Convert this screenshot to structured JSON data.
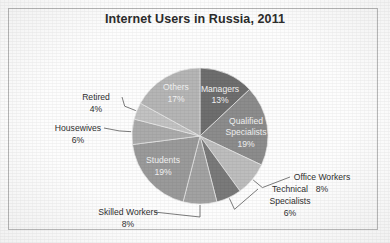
{
  "chart_data": {
    "type": "pie",
    "title": "Internet Users in Russia, 2011",
    "xlabel": "",
    "ylabel": "",
    "legend": "none",
    "grid": false,
    "units": "percent",
    "total": 100,
    "categories": [
      "Managers",
      "Qualified Specialists",
      "Office Workers",
      "Technical Specialists",
      "Skilled Workers",
      "Students",
      "Housewives",
      "Retired",
      "Others"
    ],
    "values": [
      13,
      19,
      8,
      6,
      8,
      19,
      6,
      4,
      17
    ],
    "slices": [
      {
        "label": "Managers",
        "value": 13,
        "value_text": "13%",
        "color": "#6e6e6e",
        "placement": "inside",
        "label_x": 220,
        "label_y": 92,
        "value_x": 220,
        "value_y": 103
      },
      {
        "label": "Qualified Specialists",
        "value": 19,
        "value_text": "19%",
        "color": "#8c8c8c",
        "placement": "inside",
        "label_x": 246,
        "label_y": 124,
        "value_x": 246,
        "value_y": 147,
        "label_line2": "Specialists",
        "label_y2": 135
      },
      {
        "label": "Office Workers",
        "value": 8,
        "value_text": "8%",
        "color": "#bdbdbd",
        "placement": "outside",
        "label_x": 322,
        "label_y": 180,
        "value_x": 322,
        "value_y": 192
      },
      {
        "label": "Technical Specialists",
        "value": 6,
        "value_text": "6%",
        "color": "#7a7a7a",
        "placement": "outside",
        "label_x": 290,
        "label_y": 192,
        "value_x": 290,
        "value_y": 216,
        "label_line2": "Specialists",
        "label_y2": 204
      },
      {
        "label": "Skilled Workers",
        "value": 8,
        "value_text": "8%",
        "color": "#a2a2a2",
        "placement": "outside",
        "label_x": 128,
        "label_y": 215,
        "value_x": 128,
        "value_y": 227
      },
      {
        "label": "Students",
        "value": 19,
        "value_text": "19%",
        "color": "#9a9a9a",
        "placement": "inside",
        "label_x": 163,
        "label_y": 163,
        "value_x": 163,
        "value_y": 175
      },
      {
        "label": "Housewives",
        "value": 6,
        "value_text": "6%",
        "color": "#ababab",
        "placement": "outside",
        "label_x": 78,
        "label_y": 131,
        "value_x": 78,
        "value_y": 143
      },
      {
        "label": "Retired",
        "value": 4,
        "value_text": "4%",
        "color": "#c2c2c2",
        "placement": "outside",
        "label_x": 96,
        "label_y": 100,
        "value_x": 96,
        "value_y": 112
      },
      {
        "label": "Others",
        "value": 17,
        "value_text": "17%",
        "color": "#b5b5b5",
        "placement": "inside",
        "label_x": 176,
        "label_y": 90,
        "value_x": 176,
        "value_y": 102
      }
    ],
    "geometry": {
      "cx": 200,
      "cy": 136,
      "r": 68,
      "start_angle_deg": -90,
      "direction": "clockwise"
    }
  },
  "frame": {
    "border_color": "#b9b9b9",
    "background": "#fdfdfd"
  }
}
